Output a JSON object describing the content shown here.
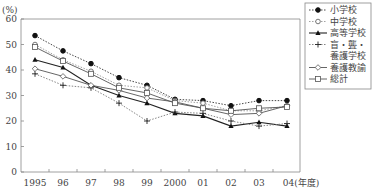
{
  "chart_data": {
    "type": "line",
    "title": "",
    "ylabel": "(%)",
    "xlabel": "(年度)",
    "ylim": [
      0,
      60
    ],
    "yticks": [
      0,
      10,
      20,
      30,
      40,
      50,
      60
    ],
    "categories": [
      "1995",
      "96",
      "97",
      "98",
      "99",
      "2000",
      "01",
      "02",
      "03",
      "04"
    ],
    "x_suffix": "(年度)",
    "grid": false,
    "legend_position": "top-right",
    "series": [
      {
        "name": "小学校",
        "marker": "filled-circle",
        "line": "dotted",
        "values": [
          53.5,
          47.5,
          42.5,
          37,
          34,
          28.5,
          28,
          26,
          28,
          28
        ]
      },
      {
        "name": "中学校",
        "marker": "open-circle",
        "line": "dotted",
        "values": [
          50,
          44,
          39.5,
          34,
          33,
          28,
          27,
          24,
          24,
          26
        ]
      },
      {
        "name": "高等学校",
        "marker": "filled-triangle",
        "line": "solid",
        "values": [
          44,
          41,
          34,
          30,
          27,
          23,
          22,
          18,
          19.5,
          18
        ]
      },
      {
        "name": "盲・聾・養護学校",
        "marker": "plus",
        "line": "dotted",
        "values": [
          38.5,
          34,
          33,
          27,
          20,
          23.5,
          23,
          20,
          18,
          19
        ]
      },
      {
        "name": "養護教諭",
        "marker": "open-diamond",
        "line": "solid",
        "values": [
          40.5,
          37.5,
          34,
          32,
          29,
          27.5,
          25,
          22.5,
          23,
          26
        ]
      },
      {
        "name": "総計",
        "marker": "open-square",
        "line": "solid",
        "values": [
          49,
          43.5,
          38.5,
          33,
          31,
          27,
          25,
          24,
          25,
          25.5
        ]
      }
    ]
  },
  "legend": {
    "items": [
      "小学校",
      "中学校",
      "高等学校",
      "盲・聾・",
      "養護学校",
      "養護教諭",
      "総計"
    ]
  }
}
